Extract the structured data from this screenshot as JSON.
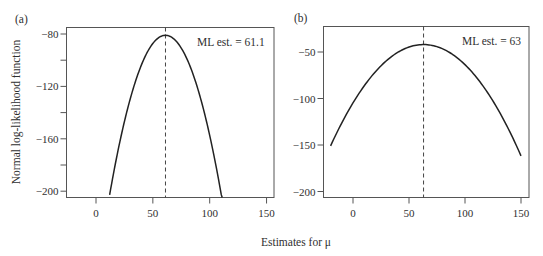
{
  "figure": {
    "xlabel": "Estimates for μ",
    "ylabel": "Normal log-likelihood function"
  },
  "chart_data": [
    {
      "type": "line",
      "panel_label": "(a)",
      "annotation": "ML est. = 61.1",
      "ml_estimate": 61.1,
      "xlabel": "Estimates for μ",
      "ylabel": "Normal log-likelihood function",
      "xlim": [
        -26,
        157
      ],
      "ylim": [
        -205,
        -75
      ],
      "xticks": [
        0,
        50,
        100,
        150
      ],
      "yticks": [
        -80,
        -120,
        -160,
        -200
      ],
      "yticks_minor": [
        -100,
        -140,
        -180
      ],
      "grid": false,
      "series": [
        {
          "name": "log-likelihood",
          "x": [
            12,
            20,
            30,
            40,
            50,
            61.1,
            70,
            80,
            90,
            100,
            111
          ],
          "y": [
            -203,
            -166.5,
            -130,
            -103.6,
            -87.2,
            -81,
            -85,
            -99.1,
            -123.1,
            -157.6,
            -206.2
          ]
        }
      ],
      "vline": {
        "x": 61.1,
        "style": "dashed"
      }
    },
    {
      "type": "line",
      "panel_label": "(b)",
      "annotation": "ML est. = 63",
      "ml_estimate": 63,
      "xlabel": "Estimates for μ",
      "ylabel": "",
      "xlim": [
        -27,
        157
      ],
      "ylim": [
        -208,
        -30
      ],
      "xticks": [
        0,
        50,
        100,
        150
      ],
      "yticks": [
        -50,
        -100,
        -150,
        -200
      ],
      "grid": false,
      "series": [
        {
          "name": "log-likelihood",
          "x": [
            -20,
            0,
            20,
            40,
            63,
            80,
            100,
            120,
            150
          ],
          "y": [
            -151,
            -104.7,
            -71.2,
            -50.4,
            -42,
            -46.6,
            -63.6,
            -93.3,
            -161.6
          ]
        }
      ],
      "vline": {
        "x": 63,
        "style": "dashed"
      }
    }
  ]
}
